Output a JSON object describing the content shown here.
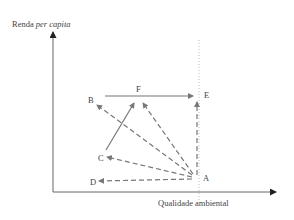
{
  "diagram": {
    "y_axis_label_prefix": "Renda ",
    "y_axis_label_italic": "per capita",
    "x_axis_label": "Qualidade ambiental",
    "points": {
      "A": "A",
      "B": "B",
      "C": "C",
      "D": "D",
      "E": "E",
      "F": "F"
    },
    "colors": {
      "axis": "#555555",
      "arrow": "#777777",
      "dotted": "#bbbbbb"
    }
  }
}
